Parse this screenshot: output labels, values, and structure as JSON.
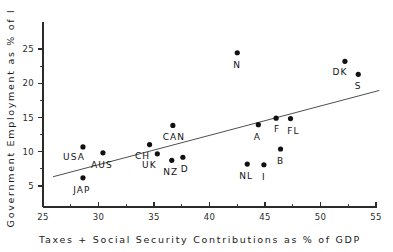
{
  "chart_data": {
    "type": "scatter",
    "title": "",
    "xlabel": "Taxes + Social Security Contributions as % of GDP",
    "ylabel": "Government Employment as % of l",
    "xlim": [
      25,
      55
    ],
    "ylim": [
      3.2,
      26.6
    ],
    "xticks": [
      25,
      30,
      35,
      40,
      45,
      50,
      55
    ],
    "xticklabels": [
      "25",
      "30",
      "35",
      "40",
      "45",
      "50",
      "55"
    ],
    "yticks": [
      5,
      10,
      15,
      20,
      25
    ],
    "yticklabels": [
      "5",
      "10",
      "15",
      "20",
      "25"
    ],
    "x_minor_ticks": [
      27.5,
      32.5,
      37.5,
      42.5,
      47.5,
      52.5
    ],
    "y_minor_ticks": [
      7.5,
      12.5,
      17.5,
      22.5
    ],
    "grid": false,
    "legend": "none",
    "point_color": "#111111",
    "line_color": "#3a3a3a",
    "points": [
      {
        "label": "USA",
        "x": 28.6,
        "y": 10.7,
        "label_dx": -9,
        "label_dy": 13
      },
      {
        "label": "JAP",
        "x": 28.6,
        "y": 6.2,
        "label_dx": -1,
        "label_dy": 15
      },
      {
        "label": "AUS",
        "x": 30.4,
        "y": 9.85,
        "label_dx": -1,
        "label_dy": 15
      },
      {
        "label": "CH",
        "x": 34.6,
        "y": 11.05,
        "label_dx": -7,
        "label_dy": 14
      },
      {
        "label": "UK",
        "x": 35.3,
        "y": 9.7,
        "label_dx": -8,
        "label_dy": 14
      },
      {
        "label": "CAN",
        "x": 36.7,
        "y": 13.85,
        "label_dx": 1,
        "label_dy": 15
      },
      {
        "label": "NZ",
        "x": 36.6,
        "y": 8.75,
        "label_dx": -1,
        "label_dy": 15
      },
      {
        "label": "D",
        "x": 37.6,
        "y": 9.2,
        "label_dx": 2,
        "label_dy": 15
      },
      {
        "label": "N",
        "x": 42.5,
        "y": 24.45,
        "label_dx": 0,
        "label_dy": 15
      },
      {
        "label": "NL",
        "x": 43.4,
        "y": 8.2,
        "label_dx": -1,
        "label_dy": 15
      },
      {
        "label": "A",
        "x": 44.4,
        "y": 13.95,
        "label_dx": -1,
        "label_dy": 15
      },
      {
        "label": "I",
        "x": 44.9,
        "y": 8.1,
        "label_dx": 0,
        "label_dy": 15
      },
      {
        "label": "F",
        "x": 46.0,
        "y": 14.9,
        "label_dx": 1,
        "label_dy": 14
      },
      {
        "label": "B",
        "x": 46.4,
        "y": 10.4,
        "label_dx": 0,
        "label_dy": 15
      },
      {
        "label": "FL",
        "x": 47.3,
        "y": 14.85,
        "label_dx": 3,
        "label_dy": 15
      },
      {
        "label": "DK",
        "x": 52.2,
        "y": 23.2,
        "label_dx": -5,
        "label_dy": 14
      },
      {
        "label": "S",
        "x": 53.4,
        "y": 21.3,
        "label_dx": 0,
        "label_dy": 15
      }
    ],
    "fit_line": {
      "x0": 25.9,
      "y0": 6.35,
      "x1": 55.3,
      "y1": 18.95
    }
  }
}
